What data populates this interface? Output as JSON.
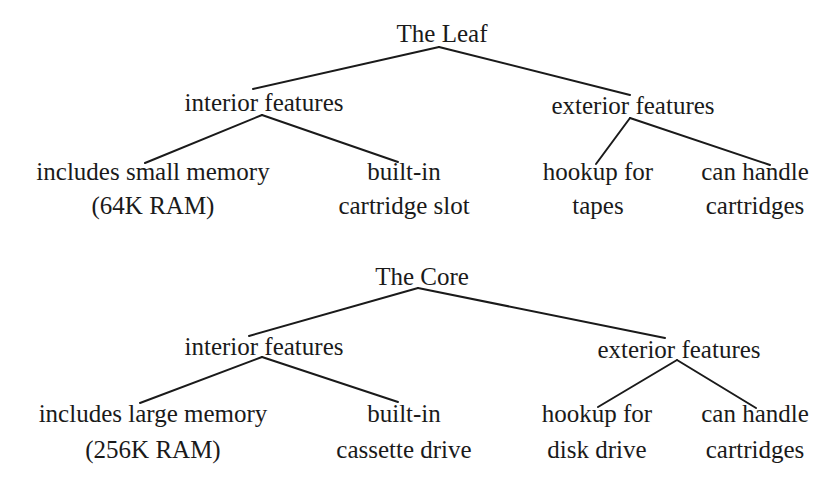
{
  "trees": [
    {
      "root": "The Leaf",
      "branches": [
        {
          "label": "interior features",
          "children": [
            {
              "lines": [
                "includes small memory",
                "(64K RAM)"
              ]
            },
            {
              "lines": [
                "built-in",
                "cartridge slot"
              ]
            }
          ]
        },
        {
          "label": "exterior features",
          "children": [
            {
              "lines": [
                "hookup for",
                "tapes"
              ]
            },
            {
              "lines": [
                "can handle",
                "cartridges"
              ]
            }
          ]
        }
      ]
    },
    {
      "root": "The Core",
      "branches": [
        {
          "label": "interior features",
          "children": [
            {
              "lines": [
                "includes large memory",
                "(256K RAM)"
              ]
            },
            {
              "lines": [
                "built-in",
                "cassette drive"
              ]
            }
          ]
        },
        {
          "label": "exterior features",
          "children": [
            {
              "lines": [
                "hookup for",
                "disk drive"
              ]
            },
            {
              "lines": [
                "can handle",
                "cartridges"
              ]
            }
          ]
        }
      ]
    }
  ]
}
